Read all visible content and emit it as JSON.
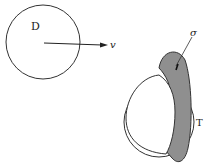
{
  "diagram": {
    "circle_d": {
      "label": "D",
      "cx": 43,
      "cy": 42,
      "r": 37
    },
    "velocity": {
      "label": "v",
      "x1": 44,
      "y1": 43,
      "x2": 104,
      "y2": 45
    },
    "sphere_t": {
      "label": "T",
      "cx": 159,
      "cy": 122,
      "r": 35
    },
    "band": {
      "label": "σ",
      "fill": "#8f8f8f"
    },
    "colors": {
      "stroke": "#333333",
      "background": "#ffffff"
    }
  }
}
